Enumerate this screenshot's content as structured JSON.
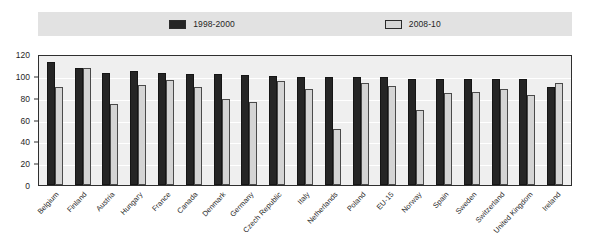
{
  "legend": {
    "entries": [
      {
        "label": "1998-2000",
        "color": "#252525",
        "icon": "legend-swatch-dark"
      },
      {
        "label": "2008-10",
        "color": "#d4d4d4",
        "icon": "legend-swatch-light"
      }
    ]
  },
  "axis": {
    "y_ticks": [
      "0",
      "20",
      "40",
      "60",
      "80",
      "100",
      "120"
    ]
  },
  "chart_data": {
    "type": "bar",
    "title": "",
    "xlabel": "",
    "ylabel": "",
    "ylim": [
      0,
      120
    ],
    "ytick_step": 20,
    "grid": true,
    "legend_position": "top",
    "categories": [
      "Belgium",
      "Finland",
      "Austria",
      "Hungary",
      "France",
      "Canada",
      "Denmark",
      "Germany",
      "Czech Republic",
      "Italy",
      "Netherlands",
      "Poland",
      "EU-15",
      "Norway",
      "Spain",
      "Sweden",
      "Switzerland",
      "United Kingdom",
      "Ireland"
    ],
    "series": [
      {
        "name": "1998-2000",
        "color": "#252525",
        "values": [
          113,
          107,
          103,
          104,
          103,
          102,
          102,
          101,
          100,
          99,
          99,
          99,
          99,
          97,
          97,
          97,
          97,
          97,
          90
        ]
      },
      {
        "name": "2008-10",
        "color": "#d4d4d4",
        "values": [
          90,
          107,
          74,
          92,
          96,
          90,
          79,
          76,
          95,
          88,
          51,
          93,
          91,
          69,
          84,
          85,
          88,
          82,
          93
        ]
      }
    ]
  }
}
